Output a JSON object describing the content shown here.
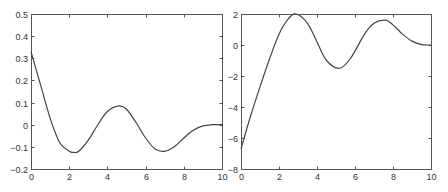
{
  "chart_data": [
    {
      "type": "line",
      "title": "",
      "xlabel": "",
      "ylabel": "",
      "xlim": [
        0,
        10
      ],
      "ylim": [
        -0.2,
        0.5
      ],
      "grid": false,
      "x_ticks": [
        0,
        2,
        4,
        6,
        8,
        10
      ],
      "x_tick_labels": [
        "0",
        "2",
        "4",
        "6",
        "8",
        "10"
      ],
      "y_ticks": [
        -0.2,
        -0.1,
        0,
        0.1,
        0.2,
        0.3,
        0.4,
        0.5
      ],
      "y_tick_labels": [
        "-0.2",
        "-0.1",
        "0",
        "0.1",
        "0.2",
        "0.3",
        "0.4",
        "0.5"
      ],
      "series": [
        {
          "name": "left-curve",
          "color": "#444444",
          "x": [
            0,
            0.5,
            1.0,
            1.5,
            2.0,
            2.25,
            2.5,
            3.0,
            3.5,
            4.0,
            4.6,
            5.0,
            5.5,
            6.0,
            6.5,
            7.0,
            7.5,
            8.0,
            8.5,
            9.0,
            9.5,
            10.0
          ],
          "y": [
            0.33,
            0.18,
            0.03,
            -0.08,
            -0.12,
            -0.125,
            -0.12,
            -0.07,
            0.0,
            0.06,
            0.085,
            0.07,
            0.01,
            -0.06,
            -0.11,
            -0.12,
            -0.1,
            -0.06,
            -0.025,
            -0.005,
            0.0,
            0.0
          ]
        }
      ],
      "plot_box_px": {
        "left": 31,
        "top": 14,
        "right": 222,
        "bottom": 169
      }
    },
    {
      "type": "line",
      "title": "",
      "xlabel": "",
      "ylabel": "",
      "xlim": [
        0,
        10
      ],
      "ylim": [
        -8,
        2
      ],
      "grid": false,
      "x_ticks": [
        0,
        2,
        4,
        6,
        8,
        10
      ],
      "x_tick_labels": [
        "0",
        "2",
        "4",
        "6",
        "8",
        "10"
      ],
      "y_ticks": [
        -8,
        -6,
        -4,
        -2,
        0,
        2
      ],
      "y_tick_labels": [
        "-8",
        "-6",
        "-4",
        "-2",
        "0",
        "2"
      ],
      "series": [
        {
          "name": "right-curve",
          "color": "#444444",
          "x": [
            0,
            0.5,
            1.0,
            1.5,
            2.0,
            2.5,
            2.9,
            3.5,
            4.0,
            4.5,
            5.2,
            5.8,
            6.5,
            7.0,
            7.6,
            8.0,
            8.5,
            9.0,
            9.5,
            10.0
          ],
          "y": [
            -6.7,
            -4.6,
            -2.7,
            -0.9,
            0.7,
            1.7,
            2.0,
            1.4,
            0.2,
            -1.0,
            -1.5,
            -0.8,
            0.7,
            1.4,
            1.6,
            1.3,
            0.7,
            0.25,
            0.03,
            0.0
          ]
        }
      ],
      "plot_box_px": {
        "left": 241,
        "top": 14,
        "right": 431,
        "bottom": 169
      }
    }
  ]
}
